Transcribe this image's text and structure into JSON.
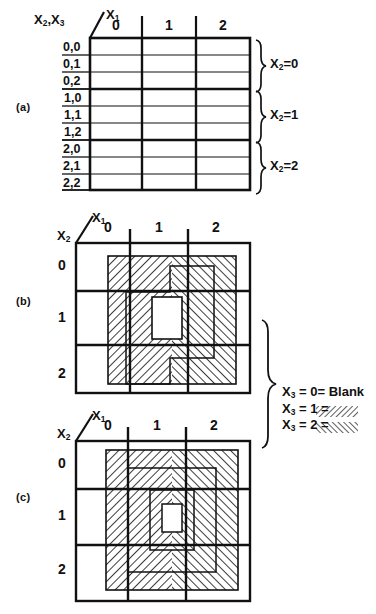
{
  "figure": {
    "type": "ternary-karnaugh-map",
    "parts": [
      {
        "key": "a",
        "label": "(a)"
      },
      {
        "key": "b",
        "label": "(b)"
      },
      {
        "key": "c",
        "label": "(c)"
      }
    ]
  },
  "part_a": {
    "corner": {
      "row_vars": "X2,X3",
      "col_var": "X1"
    },
    "col_headers": [
      "0",
      "1",
      "2"
    ],
    "row_headers": [
      "0,0",
      "0,1",
      "0,2",
      "1,0",
      "1,1",
      "1,2",
      "2,0",
      "2,1",
      "2,2"
    ],
    "group_braces": [
      {
        "label_var": "X2",
        "label_eq": "=",
        "label_val": "0"
      },
      {
        "label_var": "X2",
        "label_eq": "=",
        "label_val": "1"
      },
      {
        "label_var": "X2",
        "label_eq": "=",
        "label_val": "2"
      }
    ],
    "cells": [
      [
        "",
        "",
        ""
      ],
      [
        "",
        "",
        ""
      ],
      [
        "",
        "",
        ""
      ],
      [
        "",
        "",
        ""
      ],
      [
        "",
        "",
        ""
      ],
      [
        "",
        "",
        ""
      ],
      [
        "",
        "",
        ""
      ],
      [
        "",
        "",
        ""
      ],
      [
        "",
        "",
        ""
      ]
    ]
  },
  "part_b": {
    "corner": {
      "row_var": "X2",
      "col_var": "X1"
    },
    "col_headers": [
      "0",
      "1",
      "2"
    ],
    "row_headers": [
      "0",
      "1",
      "2"
    ],
    "map_values": [
      [
        1,
        1,
        1
      ],
      [
        1,
        0,
        1
      ],
      [
        1,
        1,
        1
      ]
    ]
  },
  "part_c": {
    "corner": {
      "row_var": "X2",
      "col_var": "X1"
    },
    "col_headers": [
      "0",
      "1",
      "2"
    ],
    "row_headers": [
      "0",
      "1",
      "2"
    ],
    "map_values": [
      [
        1,
        1,
        1
      ],
      [
        1,
        0,
        1
      ],
      [
        1,
        1,
        1
      ]
    ]
  },
  "legend": {
    "items": [
      {
        "var": "X3",
        "eq1": "=",
        "value": "0",
        "eq2": "=",
        "swatch": "blank",
        "swatch_text": "Blank"
      },
      {
        "var": "X3",
        "eq1": "=",
        "value": "1",
        "eq2": "=",
        "swatch": "forward-hatch",
        "swatch_text": ""
      },
      {
        "var": "X3",
        "eq1": "=",
        "value": "2",
        "eq2": "=",
        "swatch": "back-hatch",
        "swatch_text": ""
      }
    ]
  },
  "colors": {
    "ink": "#111111",
    "paper": "#ffffff",
    "hatch": "#1a1a1a"
  }
}
